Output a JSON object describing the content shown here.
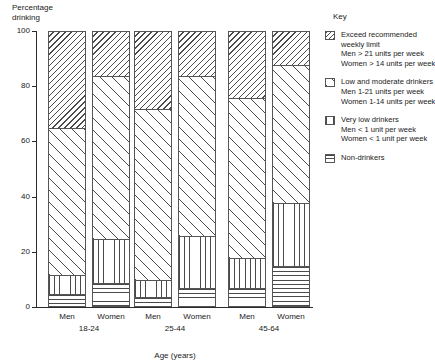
{
  "chart_data": {
    "type": "bar",
    "subtype": "stacked-100-percent",
    "title": "Percentage drinking",
    "ylabel": "Percentage drinking",
    "xlabel": "Age (years)",
    "ylim": [
      0,
      100
    ],
    "yticks": [
      0,
      20,
      40,
      60,
      80,
      100
    ],
    "ytick_labels": [
      "0",
      "20",
      "40",
      "60",
      "80",
      "100"
    ],
    "grid": false,
    "legend_position": "right",
    "categories": [
      "Men 18-24",
      "Women 18-24",
      "Men 25-44",
      "Women 25-44",
      "Men 45-64",
      "Women 45-64"
    ],
    "groups": [
      {
        "group_label": "18-24",
        "bars": [
          {
            "bar_label": "Men",
            "segments": [
              {
                "key": "non_drinkers",
                "value": 4
              },
              {
                "key": "very_low",
                "value": 7
              },
              {
                "key": "low_moderate",
                "value": 53
              },
              {
                "key": "exceed",
                "value": 36
              }
            ]
          },
          {
            "bar_label": "Women",
            "segments": [
              {
                "key": "non_drinkers",
                "value": 8
              },
              {
                "key": "very_low",
                "value": 16
              },
              {
                "key": "low_moderate",
                "value": 59
              },
              {
                "key": "exceed",
                "value": 17
              }
            ]
          }
        ]
      },
      {
        "group_label": "25-44",
        "bars": [
          {
            "bar_label": "Men",
            "segments": [
              {
                "key": "non_drinkers",
                "value": 3
              },
              {
                "key": "very_low",
                "value": 6
              },
              {
                "key": "low_moderate",
                "value": 62
              },
              {
                "key": "exceed",
                "value": 29
              }
            ]
          },
          {
            "bar_label": "Women",
            "segments": [
              {
                "key": "non_drinkers",
                "value": 6
              },
              {
                "key": "very_low",
                "value": 19
              },
              {
                "key": "low_moderate",
                "value": 58
              },
              {
                "key": "exceed",
                "value": 17
              }
            ]
          }
        ]
      },
      {
        "group_label": "45-64",
        "bars": [
          {
            "bar_label": "Men",
            "segments": [
              {
                "key": "non_drinkers",
                "value": 6
              },
              {
                "key": "very_low",
                "value": 11
              },
              {
                "key": "low_moderate",
                "value": 58
              },
              {
                "key": "exceed",
                "value": 25
              }
            ]
          },
          {
            "bar_label": "Women",
            "segments": [
              {
                "key": "non_drinkers",
                "value": 14
              },
              {
                "key": "very_low",
                "value": 23
              },
              {
                "key": "low_moderate",
                "value": 50
              },
              {
                "key": "exceed",
                "value": 13
              }
            ]
          }
        ]
      }
    ],
    "series": [
      {
        "name": "Exceed recommended weekly limit",
        "key": "exceed",
        "values": [
          36,
          17,
          29,
          17,
          25,
          13
        ]
      },
      {
        "name": "Low and moderate drinkers",
        "key": "low_moderate",
        "values": [
          53,
          59,
          62,
          58,
          58,
          50
        ]
      },
      {
        "name": "Very low drinkers",
        "key": "very_low",
        "values": [
          7,
          16,
          6,
          19,
          11,
          23
        ]
      },
      {
        "name": "Non-drinkers",
        "key": "non_drinkers",
        "values": [
          4,
          8,
          3,
          6,
          6,
          14
        ]
      }
    ]
  },
  "key": {
    "title": "Key",
    "items": [
      {
        "swatch": "diagonal-dense-hatch-swatch",
        "lines": [
          "Exceed recommended",
          "weekly limit",
          "Men > 21 units per week",
          "Women > 14 units per week"
        ]
      },
      {
        "swatch": "diagonal-sparse-hatch-swatch",
        "lines": [
          "Low and moderate drinkers",
          "Men 1-21 units per week",
          "Women 1-14 units per week"
        ]
      },
      {
        "swatch": "vertical-lines-swatch",
        "lines": [
          "Very low drinkers",
          "Men < 1 unit per week",
          "Women < 1 unit per week"
        ]
      },
      {
        "swatch": "horizontal-lines-swatch",
        "lines": [
          "Non-drinkers"
        ]
      }
    ]
  },
  "colors": {
    "ink": "#1a1a1a",
    "axis": "#2b2b2b",
    "hatch": "#4a4a4a",
    "background": "#ffffff"
  }
}
